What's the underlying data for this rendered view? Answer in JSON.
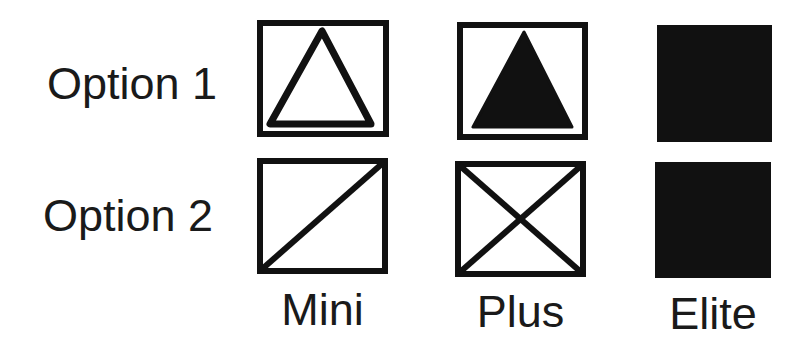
{
  "diagram": {
    "rows": [
      {
        "label": "Option 1"
      },
      {
        "label": "Option 2"
      }
    ],
    "columns": [
      {
        "label": "Mini"
      },
      {
        "label": "Plus"
      },
      {
        "label": "Elite"
      }
    ],
    "cells": [
      [
        {
          "row": "Option 1",
          "column": "Mini",
          "icon": "outlined-triangle-in-box-icon"
        },
        {
          "row": "Option 1",
          "column": "Plus",
          "icon": "filled-triangle-in-box-icon"
        },
        {
          "row": "Option 1",
          "column": "Elite",
          "icon": "filled-square-icon"
        }
      ],
      [
        {
          "row": "Option 2",
          "column": "Mini",
          "icon": "box-with-diagonal-icon"
        },
        {
          "row": "Option 2",
          "column": "Plus",
          "icon": "box-with-x-icon"
        },
        {
          "row": "Option 2",
          "column": "Elite",
          "icon": "filled-square-icon"
        }
      ]
    ],
    "colors": {
      "ink": "#111111",
      "background": "#ffffff"
    }
  }
}
